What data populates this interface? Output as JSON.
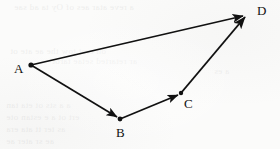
{
  "figure": {
    "type": "vector-path-diagram",
    "background_color": "#fbfbfa",
    "ink_color": "#111111",
    "canvas": {
      "width": 280,
      "height": 149
    },
    "points": [
      {
        "id": "A",
        "label": "A",
        "x": 31,
        "y": 65,
        "label_x": 14,
        "label_y": 62,
        "has_dot": true
      },
      {
        "id": "B",
        "label": "B",
        "x": 120,
        "y": 119,
        "label_x": 116,
        "label_y": 126,
        "has_dot": true
      },
      {
        "id": "C",
        "label": "C",
        "x": 181,
        "y": 93,
        "label_x": 184,
        "label_y": 97,
        "has_dot": true
      },
      {
        "id": "D",
        "label": "D",
        "x": 247,
        "y": 13,
        "label_x": 257,
        "label_y": 4,
        "has_dot": false
      }
    ],
    "vectors": [
      {
        "id": "AB",
        "from": "A",
        "to": "B",
        "label": "",
        "arrowhead": "filled-triangle"
      },
      {
        "id": "BC",
        "from": "B",
        "to": "C",
        "label": "",
        "arrowhead": "filled-triangle"
      },
      {
        "id": "CD",
        "from": "C",
        "to": "D",
        "label": "",
        "arrowhead": "filled-triangle"
      },
      {
        "id": "AD",
        "from": "A",
        "to": "D",
        "label": "",
        "arrowhead": "filled-triangle"
      }
    ],
    "bleed_through_lines": [
      {
        "text": "a reve atar aes of Oy ta ad sae",
        "x": 14,
        "y": 2,
        "size": 9
      },
      {
        "text": "on erat tow the ae ate ot",
        "x": 10,
        "y": 46,
        "size": 9
      },
      {
        "text": "ar retarted setae tarot",
        "x": 52,
        "y": 56,
        "size": 9
      },
      {
        "text": "a es",
        "x": 214,
        "y": 66,
        "size": 9
      },
      {
        "text": "a a sts ot eta tan",
        "x": 6,
        "y": 100,
        "size": 9
      },
      {
        "text": "ert ot a e estan ote",
        "x": 6,
        "y": 112,
        "size": 9
      },
      {
        "text": "as ter tt ata era",
        "x": 6,
        "y": 124,
        "size": 9
      },
      {
        "text": "ae sr ater ae",
        "x": 6,
        "y": 136,
        "size": 9
      }
    ]
  }
}
